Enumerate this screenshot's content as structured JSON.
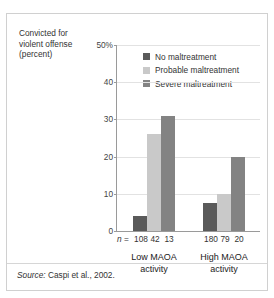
{
  "figure": {
    "axis_title_lines": [
      "Convicted for",
      "violent offense",
      "(percent)"
    ],
    "source_word": "Source:",
    "source_text": " Caspi et al., 2002."
  },
  "colors": {
    "no_maltreatment": "#5a5a5a",
    "probable_maltreatment": "#c9c9c9",
    "severe_maltreatment": "#838383",
    "gridline": "#e2e2e2",
    "axis": "#9a9a9a",
    "border": "#d0d0d0",
    "text": "#333333"
  },
  "legend": {
    "items": [
      {
        "label": "No maltreatment",
        "color": "#5a5a5a",
        "swatch_name": "legend-swatch-no-maltreatment"
      },
      {
        "label": "Probable maltreatment",
        "color": "#c9c9c9",
        "swatch_name": "legend-swatch-probable-maltreatment"
      },
      {
        "label": "Severe maltreatment",
        "color": "#838383",
        "swatch_name": "legend-swatch-severe-maltreatment"
      }
    ]
  },
  "n_row": {
    "prefix_n": "n",
    "prefix_eq": " =",
    "values": [
      "108",
      "42",
      "13",
      "180",
      "79",
      "20"
    ]
  },
  "chart_data": {
    "type": "bar",
    "title": "",
    "xlabel": "",
    "ylabel": "Convicted for violent offense (percent)",
    "ylim": [
      0,
      50
    ],
    "yticks": [
      0,
      10,
      20,
      30,
      40,
      50
    ],
    "ytick_labels": [
      "0",
      "10",
      "20",
      "30",
      "40",
      "50%"
    ],
    "grid": true,
    "legend_position": "upper-right-inside",
    "categories": [
      "Low MAOA activity",
      "High MAOA activity"
    ],
    "category_label_lines": [
      [
        "Low MAOA",
        "activity"
      ],
      [
        "High MAOA",
        "activity"
      ]
    ],
    "series": [
      {
        "name": "No maltreatment",
        "color": "#5a5a5a",
        "values": [
          4.0,
          7.5
        ],
        "n": [
          108,
          180
        ]
      },
      {
        "name": "Probable maltreatment",
        "color": "#c9c9c9",
        "values": [
          26.0,
          10.0
        ],
        "n": [
          42,
          79
        ]
      },
      {
        "name": "Severe maltreatment",
        "color": "#838383",
        "values": [
          31.0,
          20.0
        ],
        "n": [
          13,
          20
        ]
      }
    ],
    "annotations": [
      "n = 108 42 13",
      "n = 180 79 20"
    ],
    "source": "Source: Caspi et al., 2002."
  }
}
